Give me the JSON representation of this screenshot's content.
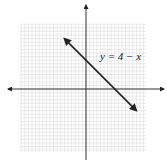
{
  "chart_data": {
    "type": "line",
    "title": "",
    "xlabel": "",
    "ylabel": "",
    "grid": true,
    "xlim": [
      -8.5,
      10.5
    ],
    "ylim": [
      -8.5,
      10.5
    ],
    "series": [
      {
        "name": "y = 4 - x",
        "equation": "y = 4 - x",
        "x": [
          -3,
          7
        ],
        "y": [
          7,
          -3
        ],
        "arrows": "both"
      }
    ],
    "annotations": [
      {
        "text": "y = 4 − x",
        "x": 5,
        "y": 4
      }
    ],
    "axes_arrows": true
  },
  "colors": {
    "grid": "#d4d4d4",
    "axis": "#333333",
    "line": "#222222",
    "background": "#ffffff"
  },
  "label": {
    "equation": "y = 4 − x"
  }
}
